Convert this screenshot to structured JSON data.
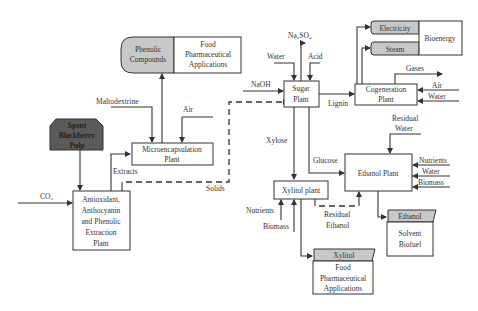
{
  "diagram": {
    "type": "process-flow",
    "nodes": {
      "spent_pulp": {
        "lines": [
          "Spent",
          "Blackberry",
          "Pulp"
        ]
      },
      "extraction_plant": {
        "lines": [
          "Antioxidant,",
          "Anthocyanin",
          "and Phenolic",
          "Extraction",
          "Plant"
        ]
      },
      "microencapsulation_plant": {
        "lines": [
          "Microencapsulation",
          "Plant"
        ]
      },
      "phenolic_compounds": {
        "lines": [
          "Phenolic",
          "Compounds"
        ]
      },
      "phenolic_apps": {
        "lines": [
          "Food",
          "Pharmaceutical",
          "Applications"
        ]
      },
      "sugar_plant": {
        "lines": [
          "Sugar",
          "Plant"
        ]
      },
      "cogeneration_plant": {
        "lines": [
          "Cogeneration",
          "Plant"
        ]
      },
      "electricity": {
        "label": "Electricity"
      },
      "steam": {
        "label": "Steam"
      },
      "bioenergy": {
        "label": "Bioenergy"
      },
      "xylitol_plant": {
        "label": "Xylitol plant"
      },
      "ethanol_plant": {
        "label": "Ethanol Plant"
      },
      "ethanol_product": {
        "label": "Ethanol",
        "uses": [
          "Solvent",
          "Biofuel"
        ]
      },
      "xylitol_product": {
        "label": "Xylitol",
        "uses": [
          "Food",
          "Pharmaceutical",
          "Applications"
        ]
      }
    },
    "streams": {
      "co2": "CO₂",
      "extracts": "Extracts",
      "solids": "Solids",
      "maltodextrine": "Maltodextrine",
      "air_micro": "Air",
      "naoh": "NaOH",
      "water_sugar": "Water",
      "acid": "Acid",
      "na2so4": "Na₂SO₄",
      "lignin": "Lignin",
      "xylose": "Xylose",
      "glucose": "Glucose",
      "gases": "Gases",
      "air_cogen": "Air",
      "water_cogen": "Water",
      "residual_water": [
        "Residual",
        "Water"
      ],
      "nutrients_eth": "Nutrients",
      "water_eth": "Water",
      "biomass_eth": "Biomass",
      "nutrients_xyl": "Nutrients",
      "biomass_xyl": "Biomass",
      "residual_ethanol": [
        "Residual",
        "Ethanol"
      ]
    },
    "colors": {
      "line": "#333333",
      "product_fill": "#c8c8c8",
      "feed_fill": "#5a5a5a",
      "background": "#ffffff"
    }
  }
}
